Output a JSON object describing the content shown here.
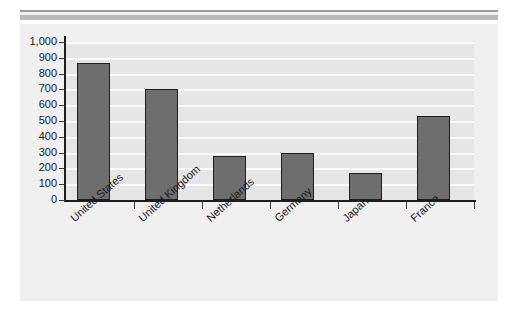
{
  "chart_data": {
    "type": "bar",
    "title": "",
    "subtitle": "",
    "xlabel": "",
    "ylabel": "",
    "categories": [
      "United States",
      "United Kingdom",
      "Netherlands",
      "Germany",
      "Japan",
      "France"
    ],
    "values": [
      870,
      700,
      280,
      300,
      170,
      530
    ],
    "series": [
      {
        "name": "",
        "values": [
          870,
          700,
          280,
          300,
          170,
          530
        ]
      }
    ],
    "ylim": [
      0,
      1000
    ],
    "ytick_values": [
      0,
      100,
      200,
      300,
      400,
      500,
      600,
      700,
      800,
      900,
      1000
    ],
    "ytick_labels": [
      "0",
      "100",
      "200",
      "300",
      "400",
      "500",
      "600",
      "700",
      "800",
      "900",
      "1,000"
    ],
    "grid": true,
    "grid_axis": "y",
    "legend": false,
    "legend_position": "none",
    "bar_color": "#6e6e6e",
    "bar_edge_color": "#1e1e1e",
    "plot_background": "#e6e6e6",
    "gridline_color": "#fbfbfb",
    "panel_background": "#f0f0f0",
    "axis_color": "#1e1e1e",
    "label_rotation": -42,
    "annotations": []
  },
  "decor": {
    "top_rule_thin_color": "#9a9a9a",
    "top_rule_thick_color": "#b8b8b8"
  }
}
